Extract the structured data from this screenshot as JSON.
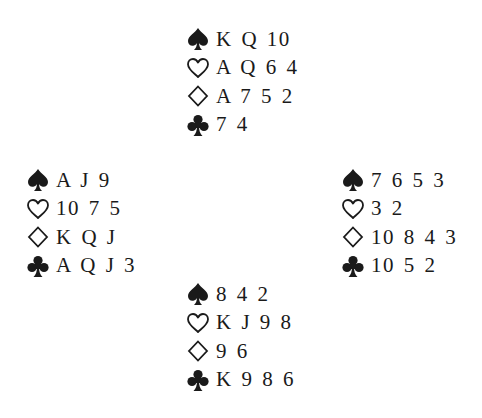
{
  "diagram": {
    "type": "bridge-deal",
    "suit_order": [
      "spades",
      "hearts",
      "diamonds",
      "clubs"
    ],
    "suit_symbols": {
      "spades": "spade-icon",
      "hearts": "heart-outline-icon",
      "diamonds": "diamond-outline-icon",
      "clubs": "club-icon"
    },
    "colors": {
      "ink": "#1a1a1a",
      "background": "#ffffff"
    },
    "hands": {
      "north": {
        "spades": "K Q 10",
        "hearts": "A Q 6 4",
        "diamonds": "A 7 5 2",
        "clubs": "7 4"
      },
      "west": {
        "spades": "A J 9",
        "hearts": "10 7 5",
        "diamonds": "K Q J",
        "clubs": "A Q J 3"
      },
      "east": {
        "spades": "7 6 5 3",
        "hearts": "3 2",
        "diamonds": "10 8 4 3",
        "clubs": "10 5 2"
      },
      "south": {
        "spades": "8 4 2",
        "hearts": "K J 9 8",
        "diamonds": "9 6",
        "clubs": "K 9 8 6"
      }
    }
  }
}
